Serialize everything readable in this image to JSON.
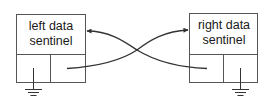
{
  "diagram": {
    "type": "doubly-linked sentinel nodes",
    "stroke_color": "#333333",
    "text_color": "#1a1a1a",
    "background": "#ffffff",
    "nodes": [
      {
        "id": "left",
        "label_line1": "left data",
        "label_line2": "sentinel",
        "lower_left_cell": "ground (null pointer)",
        "lower_right_cell": "pointer to right sentinel"
      },
      {
        "id": "right",
        "label_line1": "right data",
        "label_line2": "sentinel",
        "lower_left_cell": "pointer to left sentinel",
        "lower_right_cell": "ground (null pointer)"
      }
    ],
    "edges": [
      {
        "from": "left.lower_right_cell",
        "to": "right.data",
        "style": "curved arrow"
      },
      {
        "from": "right.lower_left_cell",
        "to": "left.data",
        "style": "curved arrow"
      }
    ]
  }
}
